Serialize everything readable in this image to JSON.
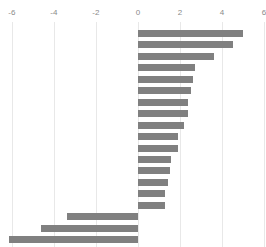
{
  "chart_data": {
    "type": "bar",
    "orientation": "horizontal",
    "title": "",
    "subtitle": "",
    "xlabel": "",
    "ylabel": "",
    "xlim": [
      -7,
      7
    ],
    "ylim": null,
    "grid": true,
    "grid_axis": "x",
    "legend": false,
    "legend_position": "none",
    "axis_position": "top",
    "bar_color": "#808080",
    "gridline_color": "#e8e8e8",
    "tick_label_color": "#8a8a8a",
    "xticks": [
      -6,
      -4,
      -2,
      0,
      2,
      4,
      6
    ],
    "xtick_labels": [
      "-6",
      "-4",
      "-2",
      "0",
      "2",
      "4",
      "6"
    ],
    "categories": [
      "1",
      "2",
      "3",
      "4",
      "5",
      "6",
      "7",
      "8",
      "9",
      "10",
      "11",
      "12",
      "13",
      "14",
      "15",
      "16",
      "17",
      "18",
      "19"
    ],
    "ytick_labels": [],
    "values": [
      5.0,
      4.5,
      3.6,
      2.7,
      2.6,
      2.5,
      2.4,
      2.4,
      2.2,
      1.9,
      1.9,
      1.55,
      1.5,
      1.45,
      1.3,
      1.3,
      -3.4,
      -4.6,
      -6.15
    ],
    "series": [
      {
        "name": "series-1",
        "color": "#808080",
        "values": [
          5.0,
          4.5,
          3.6,
          2.7,
          2.6,
          2.5,
          2.4,
          2.4,
          2.2,
          1.9,
          1.9,
          1.55,
          1.5,
          1.45,
          1.3,
          1.3,
          -3.4,
          -4.6,
          -6.15
        ]
      }
    ],
    "annotations": []
  }
}
